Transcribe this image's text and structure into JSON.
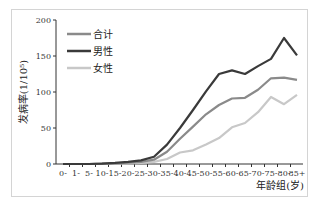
{
  "chart_data": {
    "type": "line",
    "title": "",
    "xlabel": "年龄组(岁)",
    "ylabel": "发病率(1/10⁵)",
    "ylim": [
      0,
      200
    ],
    "yticks": [
      0,
      50,
      100,
      150,
      200
    ],
    "grid": false,
    "legend_position": "upper-left",
    "categories": [
      "0-",
      "1-",
      "5-",
      "10-",
      "15-",
      "20-",
      "25-",
      "30-",
      "35-",
      "40-",
      "45-",
      "50-",
      "55-",
      "60-",
      "65-",
      "70-",
      "75-",
      "80-",
      "85+"
    ],
    "series": [
      {
        "name": "合计",
        "color": "#8a8a8a",
        "values": [
          0,
          0,
          0,
          0.5,
          1,
          2,
          3,
          6,
          17,
          35,
          52,
          69,
          82,
          91,
          92,
          103,
          119,
          120,
          117
        ]
      },
      {
        "name": "男性",
        "color": "#3a3a3a",
        "values": [
          0,
          0,
          0,
          0.5,
          1.5,
          3,
          5,
          10,
          27,
          50,
          75,
          101,
          125,
          130,
          125,
          136,
          146,
          175,
          151
        ]
      },
      {
        "name": "女性",
        "color": "#c8c8c8",
        "values": [
          0,
          0,
          0,
          0,
          0.5,
          1,
          1.5,
          3,
          7,
          16,
          19,
          27,
          36,
          51,
          57,
          72,
          93,
          83,
          96
        ]
      }
    ]
  }
}
